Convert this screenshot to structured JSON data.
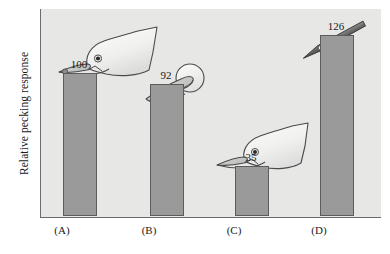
{
  "figure": {
    "y_axis_label": "Relative pecking response",
    "plot_background_color": "#e7e7e5",
    "bar_fill_color": "#9a9a9a",
    "bar_stroke_color": "#5c5c5c"
  },
  "chart_data": {
    "type": "bar",
    "title": "",
    "xlabel": "",
    "ylabel": "Relative pecking response",
    "categories": [
      "(A)",
      "(B)",
      "(C)",
      "(D)"
    ],
    "values": [
      100,
      92,
      35,
      126
    ],
    "value_labels": [
      "100",
      "92",
      "35",
      "126"
    ],
    "ylim": [
      0,
      145
    ],
    "grid": false,
    "legend": "none",
    "annotations": [
      {
        "category": "(A)",
        "icon": "gull-head-with-red-spot-icon",
        "description": "Complete herring gull head with yellow bill and red spot"
      },
      {
        "category": "(B)",
        "icon": "bill-with-red-spot-icon",
        "description": "Isolated bill with red spot and round disk head"
      },
      {
        "category": "(C)",
        "icon": "gull-head-without-spot-icon",
        "description": "Complete herring gull head with bill lacking the red spot"
      },
      {
        "category": "(D)",
        "icon": "striped-rod-icon",
        "description": "Thin red rod with three white stripes (supernormal stimulus)"
      }
    ]
  }
}
